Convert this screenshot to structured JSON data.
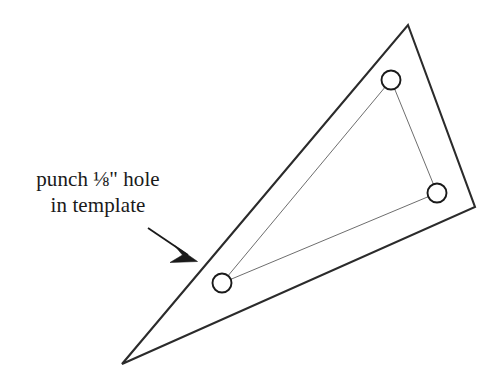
{
  "figure": {
    "background_color": "#ffffff",
    "annotation": {
      "line1": "punch ⅛\" hole",
      "line2": "in template",
      "color": "#1a1a1a"
    },
    "leader_arrow": {
      "name": "leader-arrow",
      "from": [
        148,
        228
      ],
      "to": [
        196,
        260
      ],
      "color": "#1a1a1a",
      "stroke_width": 1.8
    },
    "outer_triangle": {
      "name": "template-outline",
      "points": [
        [
          408,
          25
        ],
        [
          475,
          207
        ],
        [
          122,
          364
        ]
      ],
      "stroke_color": "#2b2b2b",
      "stroke_width": 2.1,
      "fill": "none"
    },
    "inner_triangle": {
      "name": "hole-connector-triangle",
      "points": [
        [
          391,
          80
        ],
        [
          437,
          193
        ],
        [
          222,
          283
        ]
      ],
      "stroke_color": "#6e6e6e",
      "stroke_width": 1.0,
      "fill": "none"
    },
    "holes": [
      {
        "name": "hole-top",
        "cx": 391,
        "cy": 80,
        "r": 9.5,
        "stroke_color": "#1a1a1a",
        "stroke_width": 1.9,
        "fill": "#ffffff"
      },
      {
        "name": "hole-right",
        "cx": 437,
        "cy": 193,
        "r": 9.5,
        "stroke_color": "#1a1a1a",
        "stroke_width": 1.9,
        "fill": "#ffffff"
      },
      {
        "name": "hole-bottom-left",
        "cx": 222,
        "cy": 283,
        "r": 9.5,
        "stroke_color": "#1a1a1a",
        "stroke_width": 1.9,
        "fill": "#ffffff"
      }
    ]
  }
}
